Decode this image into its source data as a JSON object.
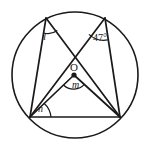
{
  "figure": {
    "name": "circle-geometry-diagram",
    "type": "euclidean-geometry-figure",
    "stroke_color": "#1a1a1a",
    "background_color": "#ffffff",
    "labels": {
      "angle_l": "l",
      "angle_known": "47°",
      "center": "O",
      "angle_m": "m",
      "angle_n": "n"
    },
    "geometry": {
      "circle": {
        "cx": 75,
        "cy": 75,
        "r": 63
      },
      "center_dot": {
        "cx": 74,
        "cy": 75,
        "r": 2.6
      },
      "points": {
        "A_top_left": {
          "x": 46,
          "y": 18
        },
        "B_top_right": {
          "x": 105,
          "y": 18
        },
        "C_bottom_left": {
          "x": 30,
          "y": 117
        },
        "D_bottom_right": {
          "x": 120,
          "y": 117
        }
      },
      "segments": [
        {
          "name": "chord-A-D",
          "from": "A_top_left",
          "to": "D_bottom_right"
        },
        {
          "name": "chord-B-C",
          "from": "B_top_right",
          "to": "C_bottom_left"
        },
        {
          "name": "chord-A-C",
          "from": "A_top_left",
          "to": "C_bottom_left"
        },
        {
          "name": "chord-B-D",
          "from": "B_top_right",
          "to": "D_bottom_right"
        },
        {
          "name": "chord-C-D-base",
          "from": "C_bottom_left",
          "to": "D_bottom_right"
        },
        {
          "name": "radius-O-C",
          "from": "center",
          "to": "C_bottom_left"
        },
        {
          "name": "radius-O-D",
          "from": "center",
          "to": "D_bottom_right"
        }
      ],
      "angle_arcs": [
        {
          "name": "arc-angle-l",
          "vertex": "A_top_left"
        },
        {
          "name": "arc-angle-47",
          "vertex": "B_top_right"
        },
        {
          "name": "arc-angle-m",
          "vertex": "center"
        },
        {
          "name": "arc-angle-n",
          "vertex": "C_bottom_left"
        }
      ]
    }
  }
}
